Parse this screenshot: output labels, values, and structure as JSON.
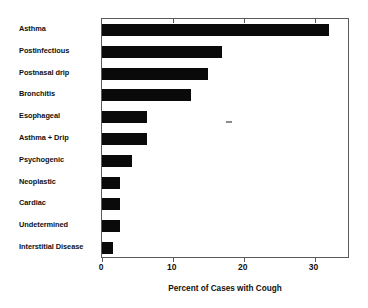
{
  "chart_data": {
    "type": "bar",
    "orientation": "horizontal",
    "title": "",
    "subtitle": "",
    "xlabel": "Percent of Cases with Cough",
    "ylabel": "",
    "categories": [
      "Asthma",
      "Postinfectious",
      "Postnasal drip",
      "Bronchitis",
      "Esophageal",
      "Asthma + Drip",
      "Psychogenic",
      "Neoplastic",
      "Cardiac",
      "Undetermined",
      "Interstitial Disease"
    ],
    "values": [
      32,
      17,
      15,
      12.5,
      6.3,
      6.3,
      4.3,
      2.6,
      2.6,
      2.6,
      1.5
    ],
    "xlim": [
      0,
      35
    ],
    "xticks": [
      0,
      10,
      20,
      30
    ],
    "xtick_labels": [
      "0",
      "10",
      "20",
      "30"
    ],
    "grid": false,
    "legend": false,
    "bar_color": "#0a0a0a",
    "frame_color": "#5a5a5a",
    "background_color": "#ffffff"
  },
  "annotations": {
    "speck": ""
  }
}
